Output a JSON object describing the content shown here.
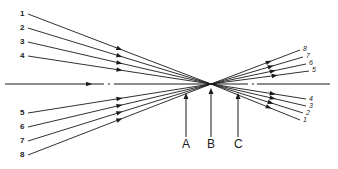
{
  "diagram": {
    "type": "ray-convergence",
    "colors": {
      "stroke": "#1a1a1a",
      "background": "#ffffff"
    },
    "focal_point": {
      "x": 211,
      "y": 84
    },
    "axis": {
      "y": 84,
      "x_start": 5,
      "x_end": 330
    },
    "left_rays": [
      {
        "label": "1",
        "x": 28,
        "y": 14
      },
      {
        "label": "2",
        "x": 28,
        "y": 28
      },
      {
        "label": "3",
        "x": 28,
        "y": 42
      },
      {
        "label": "4",
        "x": 28,
        "y": 56
      },
      {
        "label": "5",
        "x": 28,
        "y": 113
      },
      {
        "label": "6",
        "x": 28,
        "y": 127
      },
      {
        "label": "7",
        "x": 28,
        "y": 141
      },
      {
        "label": "8",
        "x": 28,
        "y": 155
      }
    ],
    "right_rays": [
      {
        "label": "8",
        "x": 300,
        "y": 50
      },
      {
        "label": "7",
        "x": 303,
        "y": 57
      },
      {
        "label": "6",
        "x": 306,
        "y": 64
      },
      {
        "label": "5",
        "x": 309,
        "y": 71
      },
      {
        "label": "4",
        "x": 306,
        "y": 99
      },
      {
        "label": "3",
        "x": 306,
        "y": 106
      },
      {
        "label": "2",
        "x": 303,
        "y": 113
      },
      {
        "label": "1",
        "x": 300,
        "y": 120
      }
    ],
    "planes": [
      {
        "label": "A",
        "x": 186
      },
      {
        "label": "B",
        "x": 211
      },
      {
        "label": "C",
        "x": 238
      }
    ]
  }
}
